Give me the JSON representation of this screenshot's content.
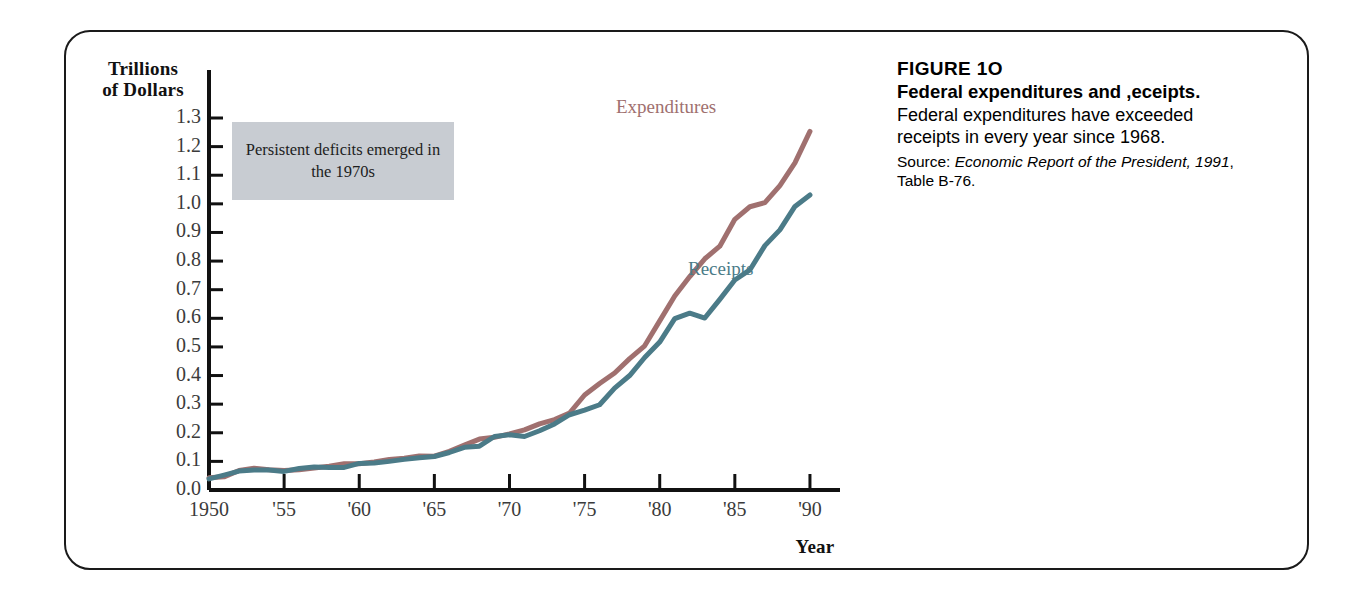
{
  "figure": {
    "number_label": "FIGURE 1O",
    "title": "Federal expenditures and ,eceipts.",
    "body": "Federal expenditures have exceeded receipts in every year since 1968.",
    "source_prefix": "Source: ",
    "source_italic": "Economic Report of the President, 1991",
    "source_suffix": ", Table B-76."
  },
  "annotation": {
    "text": "Persistent deficits emerged in the 1970s",
    "background_color": "#c8ccd2"
  },
  "colors": {
    "expenditures": "#a0706f",
    "receipts": "#4b7b88",
    "axis": "#111111",
    "frame": "#1a1a1a"
  },
  "chart_data": {
    "type": "line",
    "xlabel": "Year",
    "ylabel": "Trillions of Dollars",
    "ylabel_lines": [
      "Trillions",
      "of Dollars"
    ],
    "xlim": [
      1950,
      1992
    ],
    "ylim": [
      0.0,
      1.35
    ],
    "grid": false,
    "legend": "inline-labels",
    "ytick_labels": [
      "1.3",
      "1.2",
      "1.1",
      "1.0",
      "0.9",
      "0.8",
      "0.7",
      "0.6",
      "0.5",
      "0.4",
      "0.3",
      "0.2",
      "0.1",
      "0.0"
    ],
    "yticks": [
      1.3,
      1.2,
      1.1,
      1.0,
      0.9,
      0.8,
      0.7,
      0.6,
      0.5,
      0.4,
      0.3,
      0.2,
      0.1,
      0.0
    ],
    "xtick_labels": [
      "1950",
      "'55",
      "'60",
      "'65",
      "'70",
      "'75",
      "'80",
      "'85",
      "'90"
    ],
    "xticks": [
      1950,
      1955,
      1960,
      1965,
      1970,
      1975,
      1980,
      1985,
      1990
    ],
    "x": [
      1950,
      1951,
      1952,
      1953,
      1954,
      1955,
      1956,
      1957,
      1958,
      1959,
      1960,
      1961,
      1962,
      1963,
      1964,
      1965,
      1966,
      1967,
      1968,
      1969,
      1970,
      1971,
      1972,
      1973,
      1974,
      1975,
      1976,
      1977,
      1978,
      1979,
      1980,
      1981,
      1982,
      1983,
      1984,
      1985,
      1986,
      1987,
      1988,
      1989,
      1990
    ],
    "series": [
      {
        "name": "Expenditures",
        "color": "#a0706f",
        "values": [
          0.043,
          0.046,
          0.068,
          0.076,
          0.071,
          0.068,
          0.071,
          0.077,
          0.083,
          0.092,
          0.092,
          0.098,
          0.107,
          0.111,
          0.119,
          0.118,
          0.135,
          0.157,
          0.178,
          0.184,
          0.196,
          0.21,
          0.231,
          0.246,
          0.269,
          0.332,
          0.372,
          0.409,
          0.459,
          0.504,
          0.591,
          0.678,
          0.746,
          0.808,
          0.852,
          0.946,
          0.99,
          1.004,
          1.064,
          1.143,
          1.253
        ]
      },
      {
        "name": "Receipts",
        "color": "#4b7b88",
        "values": [
          0.039,
          0.052,
          0.066,
          0.07,
          0.07,
          0.065,
          0.075,
          0.08,
          0.079,
          0.079,
          0.093,
          0.094,
          0.1,
          0.107,
          0.113,
          0.117,
          0.131,
          0.149,
          0.153,
          0.187,
          0.193,
          0.187,
          0.207,
          0.231,
          0.263,
          0.279,
          0.298,
          0.356,
          0.4,
          0.463,
          0.517,
          0.599,
          0.618,
          0.601,
          0.666,
          0.734,
          0.769,
          0.854,
          0.909,
          0.991,
          1.031
        ]
      }
    ]
  }
}
